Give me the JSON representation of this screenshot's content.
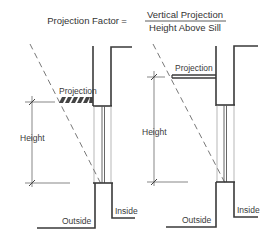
{
  "formula": {
    "lhs": "Projection Factor",
    "equals": "=",
    "numerator": "Vertical Projection",
    "denominator": "Height Above Sill"
  },
  "left_diagram": {
    "projection_label": "Projection",
    "height_label": "Height",
    "outside_label": "Outside",
    "inside_label": "Inside",
    "projection_style": "hatched"
  },
  "right_diagram": {
    "projection_label": "Projection",
    "height_label": "Height",
    "outside_label": "Outside",
    "inside_label": "Inside",
    "projection_style": "solid-shelf"
  },
  "colors": {
    "line": "#3a3a3a",
    "thin_line": "#777777",
    "background": "#ffffff"
  }
}
